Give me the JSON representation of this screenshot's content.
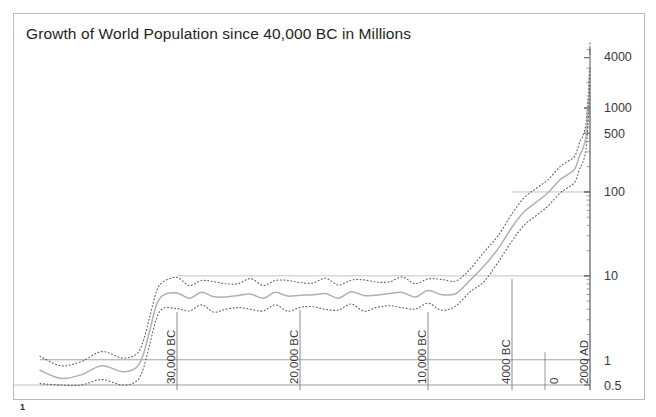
{
  "chart_data": {
    "type": "line",
    "title": "Growth of World Population since 40,000 BC in Millions",
    "xlabel": "",
    "ylabel": "",
    "scale": "log",
    "grid": true,
    "legend": "none",
    "ylim": [
      0.5,
      5000
    ],
    "y_ticks": [
      "4000",
      "1000",
      "500",
      "100",
      "10",
      "1",
      "0.5"
    ],
    "y_tick_values": [
      4000,
      1000,
      500,
      100,
      10,
      1,
      0.5
    ],
    "gridlines_at": [
      100,
      10,
      1,
      0.5
    ],
    "x_ticks": [
      "30,000 BC",
      "20,000 BC",
      "10,000 BC",
      "4000 BC",
      "0",
      "2000 AD"
    ],
    "x_tick_years": [
      -30000,
      -20000,
      -10000,
      -4000,
      0,
      2000
    ],
    "xlim_years": [
      -40000,
      2000
    ],
    "series": [
      {
        "name": "upper estimate",
        "style": "dotted",
        "x": [
          -40000,
          -38500,
          -37000,
          -35500,
          -34000,
          -33000,
          -32500,
          -32000,
          -31500,
          -31000,
          -30000,
          -29000,
          -28000,
          -27000,
          -26000,
          -25000,
          -24000,
          -23000,
          -22000,
          -21000,
          -20000,
          -19000,
          -18000,
          -17000,
          -16000,
          -15000,
          -14000,
          -13000,
          -12000,
          -11000,
          -10000,
          -9000,
          -8000,
          -7000,
          -6000,
          -5000,
          -4000,
          -3000,
          -2000,
          -1000,
          0,
          500,
          1000,
          1300,
          1500,
          1700,
          1800,
          1900,
          1950,
          2000
        ],
        "values": [
          1.1,
          0.85,
          0.95,
          1.25,
          1.05,
          1.15,
          1.6,
          3.2,
          6.5,
          8.5,
          9.0,
          8.2,
          8.8,
          8.0,
          8.6,
          8.1,
          8.7,
          8.2,
          8.8,
          8.3,
          8.9,
          8.2,
          8.8,
          8.3,
          8.9,
          8.4,
          9.0,
          8.5,
          9.1,
          8.6,
          9.2,
          8.5,
          9.3,
          12.0,
          18.0,
          30.0,
          55.0,
          85.0,
          110.0,
          140.0,
          200.0,
          230.0,
          270.0,
          390.0,
          450.0,
          600.0,
          900.0,
          1650.0,
          2600.0,
          6200.0
        ]
      },
      {
        "name": "central estimate",
        "style": "solid",
        "x": [
          -40000,
          -38500,
          -37000,
          -35500,
          -34000,
          -33000,
          -32500,
          -32000,
          -31500,
          -31000,
          -30000,
          -29000,
          -28000,
          -27000,
          -26000,
          -25000,
          -24000,
          -23000,
          -22000,
          -21000,
          -20000,
          -19000,
          -18000,
          -17000,
          -16000,
          -15000,
          -14000,
          -13000,
          -12000,
          -11000,
          -10000,
          -9000,
          -8000,
          -7000,
          -6000,
          -5000,
          -4000,
          -3000,
          -2000,
          -1000,
          0,
          500,
          1000,
          1300,
          1500,
          1700,
          1800,
          1900,
          1950,
          2000
        ],
        "values": [
          0.75,
          0.6,
          0.66,
          0.85,
          0.72,
          0.8,
          1.1,
          2.2,
          4.5,
          5.9,
          6.2,
          5.7,
          6.1,
          5.6,
          5.9,
          5.6,
          6.0,
          5.7,
          6.1,
          5.7,
          6.2,
          5.7,
          6.1,
          5.7,
          6.2,
          5.8,
          6.2,
          5.9,
          6.3,
          5.9,
          6.4,
          5.9,
          6.5,
          8.5,
          13.0,
          21.0,
          38.0,
          58.0,
          75.0,
          98.0,
          140.0,
          160.0,
          190.0,
          270.0,
          320.0,
          420.0,
          630.0,
          1150.0,
          1800.0,
          4300.0
        ]
      },
      {
        "name": "lower estimate",
        "style": "dotted",
        "x": [
          -40000,
          -38500,
          -37000,
          -35500,
          -34000,
          -33000,
          -32500,
          -32000,
          -31500,
          -31000,
          -30000,
          -29000,
          -28000,
          -27000,
          -26000,
          -25000,
          -24000,
          -23000,
          -22000,
          -21000,
          -20000,
          -19000,
          -18000,
          -17000,
          -16000,
          -15000,
          -14000,
          -13000,
          -12000,
          -11000,
          -10000,
          -9000,
          -8000,
          -7000,
          -6000,
          -5000,
          -4000,
          -3000,
          -2000,
          -1000,
          0,
          500,
          1000,
          1300,
          1500,
          1700,
          1800,
          1900,
          1950,
          2000
        ],
        "values": [
          0.52,
          0.42,
          0.46,
          0.58,
          0.5,
          0.55,
          0.75,
          1.5,
          3.1,
          4.1,
          4.3,
          3.9,
          4.2,
          3.9,
          4.1,
          3.9,
          4.2,
          3.9,
          4.2,
          4.0,
          4.3,
          4.0,
          4.2,
          4.0,
          4.3,
          4.0,
          4.3,
          4.1,
          4.4,
          4.1,
          4.4,
          4.1,
          4.5,
          6.0,
          9.0,
          14.5,
          26.0,
          40.0,
          52.0,
          68.0,
          97.0,
          112.0,
          132.0,
          187.0,
          222.0,
          292.0,
          437.0,
          800.0,
          1250.0,
          3000.0
        ]
      }
    ]
  },
  "footnote": {
    "marker": "1"
  },
  "colors": {
    "frame": "#b9b9b9",
    "axis": "#6d6d6d",
    "grid": "#a9a9a9",
    "curve": "#b0b0b0",
    "envelope": "#5a5a5a",
    "text": "#3a3a3a",
    "title": "#231f20"
  }
}
